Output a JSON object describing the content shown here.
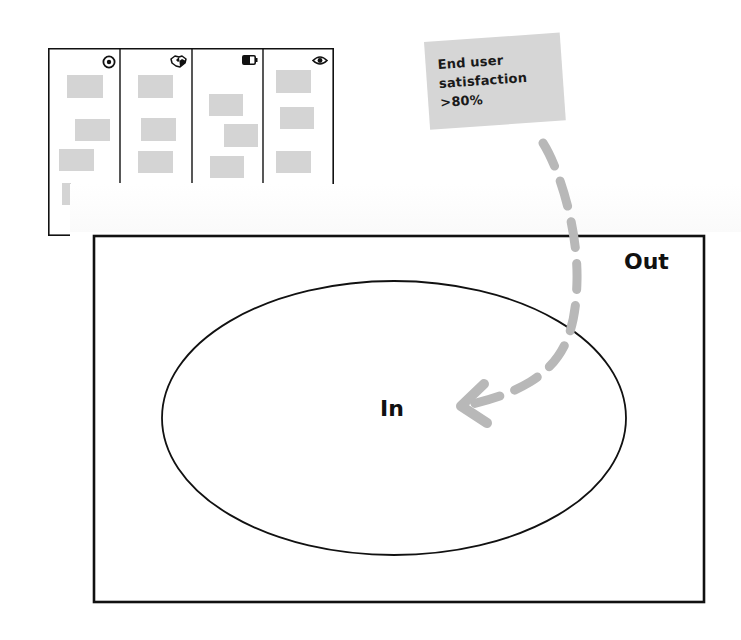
{
  "board": {
    "columns": [
      {
        "icon": "target-icon",
        "stickies": [
          [
            19,
            27,
            36,
            23
          ],
          [
            27,
            71,
            35,
            22
          ],
          [
            11,
            101,
            35,
            22
          ]
        ]
      },
      {
        "icon": "handshake-icon",
        "stickies": [
          [
            90,
            27,
            35,
            23
          ],
          [
            93,
            70,
            35,
            23
          ],
          [
            90,
            103,
            35,
            22
          ]
        ]
      },
      {
        "icon": "battery-icon",
        "stickies": [
          [
            161,
            46,
            34,
            22
          ],
          [
            176,
            76,
            34,
            23
          ],
          [
            162,
            108,
            34,
            22
          ]
        ]
      },
      {
        "icon": "eye-icon",
        "stickies": [
          [
            228,
            22,
            35,
            23
          ],
          [
            232,
            59,
            34,
            22
          ],
          [
            228,
            103,
            35,
            22
          ]
        ]
      }
    ],
    "extra_sticky": [
      14,
      135,
      9,
      22
    ]
  },
  "note": {
    "text": "End user\nsatisfaction\n>80%",
    "color": "#d6d6d6"
  },
  "diagram": {
    "outer_label": "Out",
    "inner_label": "In",
    "outer_rect": {
      "x": 93,
      "y": 235,
      "w": 612,
      "h": 368
    },
    "ellipse": {
      "cx": 394,
      "cy": 418,
      "rx": 232,
      "ry": 137
    },
    "arrow_color": "#b8b8b8"
  }
}
